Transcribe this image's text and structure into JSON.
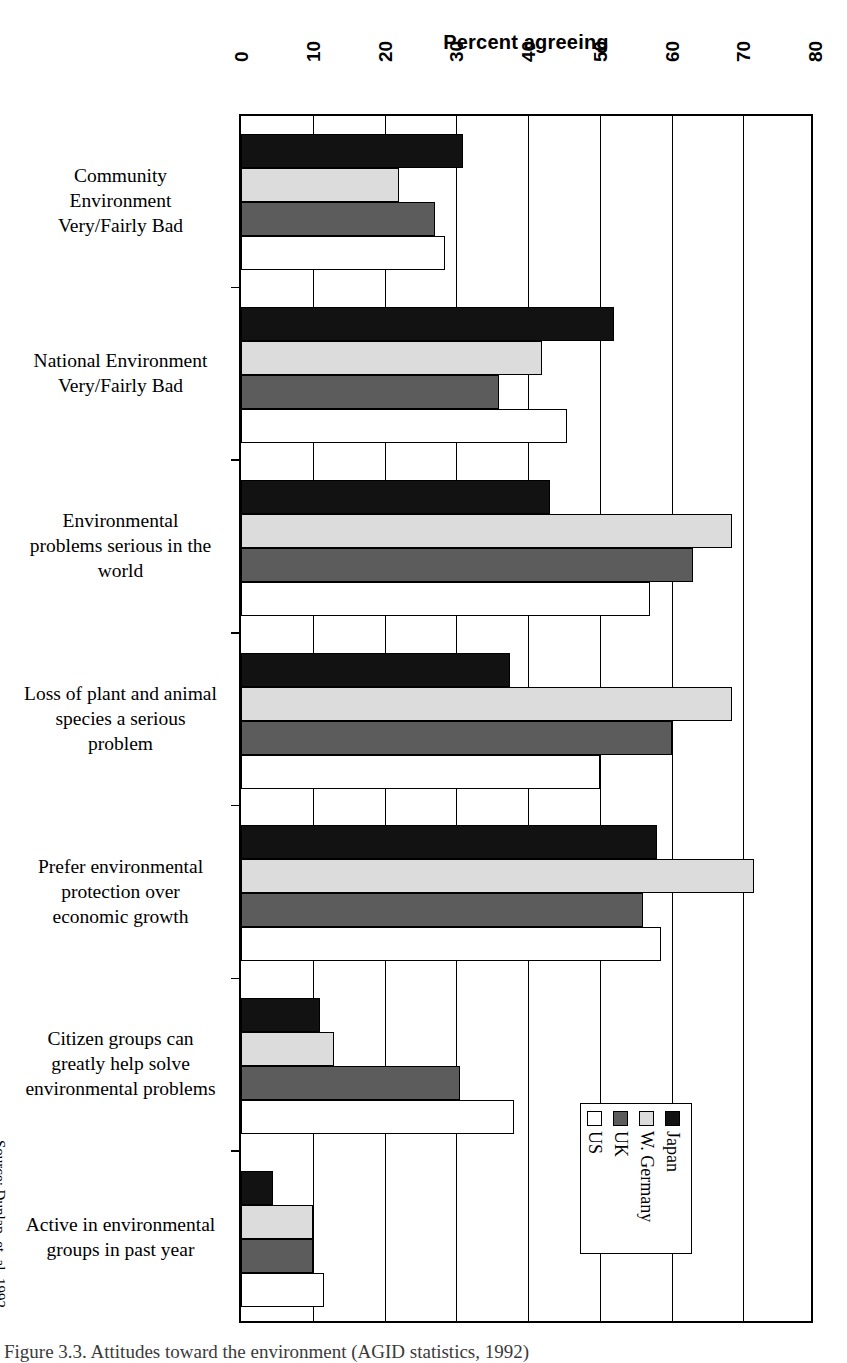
{
  "chart_data": {
    "type": "bar",
    "orientation": "horizontal",
    "title": "Percent agreeing",
    "xlabel": "",
    "ylabel": "",
    "xlim": [
      0,
      80
    ],
    "xticks": [
      0,
      10,
      20,
      30,
      40,
      50,
      60,
      70,
      80
    ],
    "grid": true,
    "legend_position": "inside-bottom-right",
    "categories": [
      "Community Environment Very/Fairly Bad",
      "National Environment Very/Fairly Bad",
      "Environmental problems serious in the world",
      "Loss of plant and animal species a serious problem",
      "Prefer environmental protection over economic growth",
      "Citizen groups can greatly help solve environmental problems",
      "Active in environmental groups in past year"
    ],
    "series": [
      {
        "name": "Japan",
        "color": "#121212",
        "values": [
          31,
          52,
          43,
          37.5,
          58,
          11,
          4.5
        ]
      },
      {
        "name": "W. Germany",
        "color": "#dcdcdc",
        "values": [
          22,
          42,
          68.5,
          68.5,
          71.5,
          13,
          10
        ]
      },
      {
        "name": "UK",
        "color": "#5c5c5c",
        "values": [
          27,
          36,
          63,
          60,
          56,
          30.5,
          10
        ]
      },
      {
        "name": "US",
        "color": "#ffffff",
        "values": [
          28.5,
          45.5,
          57,
          50,
          58.5,
          38,
          11.5
        ]
      }
    ],
    "source": "Source: Dunlap, et. al. 1992"
  },
  "title": "Percent agreeing",
  "axis": {
    "ticks": [
      "0",
      "10",
      "20",
      "30",
      "40",
      "50",
      "60",
      "70",
      "80"
    ]
  },
  "categories": [
    {
      "lines": [
        "Community",
        "Environment",
        "Very/Fairly Bad"
      ]
    },
    {
      "lines": [
        "National Environment",
        "Very/Fairly Bad"
      ]
    },
    {
      "lines": [
        "Environmental",
        "problems serious in the",
        "world"
      ]
    },
    {
      "lines": [
        "Loss of plant and animal",
        "species a serious",
        "problem"
      ]
    },
    {
      "lines": [
        "Prefer environmental",
        "protection over",
        "economic growth"
      ]
    },
    {
      "lines": [
        "Citizen groups can",
        "greatly help solve",
        "environmental problems"
      ]
    },
    {
      "lines": [
        "Active in environmental",
        "groups in past year"
      ]
    }
  ],
  "legend": {
    "items": [
      {
        "label": "Japan",
        "key": "japan"
      },
      {
        "label": "W. Germany",
        "key": "wgermany"
      },
      {
        "label": "UK",
        "key": "uk"
      },
      {
        "label": "US",
        "key": "us"
      }
    ]
  },
  "source_note": "Source: Dunlap, et. al. 1992",
  "caption": "Figure 3.3. Attitudes toward the environment (AGID statistics, 1992)"
}
